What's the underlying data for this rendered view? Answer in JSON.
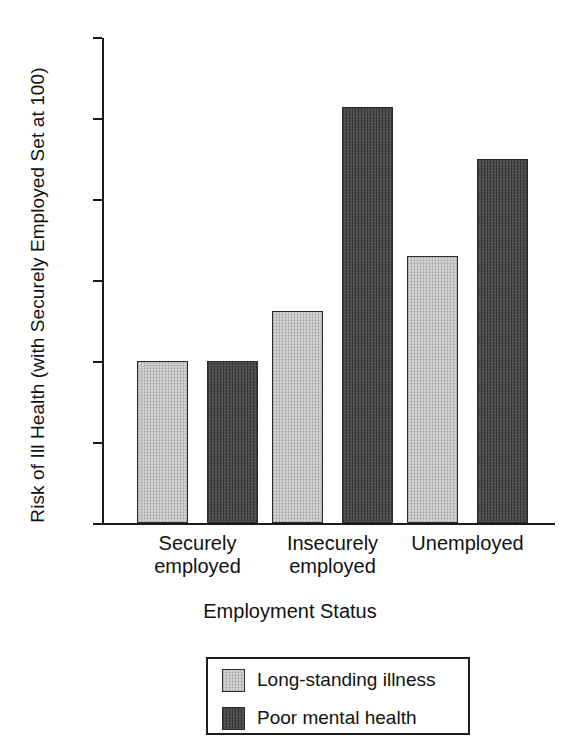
{
  "chart_data": {
    "type": "bar",
    "title": "",
    "xlabel": "Employment Status",
    "ylabel": "Risk of Ill Health (with Securely Employed Set at 100)",
    "categories": [
      "Securely employed",
      "Insecurely employed",
      "Unemployed"
    ],
    "category_lines": [
      [
        "Securely",
        "employed"
      ],
      [
        "Insecurely",
        "employed"
      ],
      [
        "Unemployed",
        ""
      ]
    ],
    "series": [
      {
        "name": "Long-standing illness",
        "color": "#d2d2d2",
        "values": [
          100,
          131,
          165
        ]
      },
      {
        "name": "Poor mental health",
        "color": "#4b4b4b",
        "values": [
          100,
          257,
          225
        ]
      }
    ],
    "ylim": [
      0,
      300
    ],
    "yticks": [
      300,
      250,
      200,
      150,
      100,
      50,
      0
    ],
    "ytick_labels": [
      "300",
      "250",
      "200",
      "150",
      "100",
      "50",
      "0"
    ],
    "grid": false,
    "legend_position": "below-plot",
    "axis_color": "#1a1a1a",
    "background": "#ffffff"
  },
  "legend": {
    "items": [
      {
        "label": "Long-standing illness",
        "swatch": "light-gray-swatch"
      },
      {
        "label": "Poor mental health",
        "swatch": "dark-gray-swatch"
      }
    ]
  }
}
